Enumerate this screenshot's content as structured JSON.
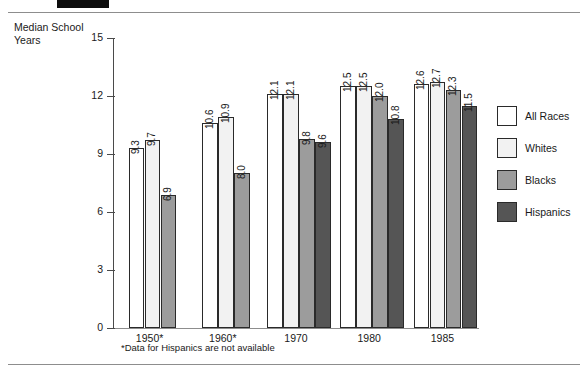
{
  "header": {
    "figure_number": "12",
    "title": "1950-1985"
  },
  "axis_title": "Median School\nYears",
  "footnote": "*Data for Hispanics are not available",
  "legend": {
    "items": [
      {
        "label": "All Races",
        "color": "#ffffff"
      },
      {
        "label": "Whites",
        "color": "#f2f2f2"
      },
      {
        "label": "Blacks",
        "color": "#9c9c9c"
      },
      {
        "label": "Hispanics",
        "color": "#555555"
      }
    ]
  },
  "chart_data": {
    "type": "bar",
    "title": "1950-1985",
    "xlabel": "",
    "ylabel": "Median School Years",
    "ylim": [
      0,
      15
    ],
    "yticks": [
      "0",
      "3",
      "6",
      "9",
      "12",
      "15"
    ],
    "grid": false,
    "legend_position": "right",
    "categories": [
      "1950*",
      "1960*",
      "1970",
      "1980",
      "1985"
    ],
    "series": [
      {
        "name": "All Races",
        "color": "#ffffff",
        "values": [
          9.3,
          10.6,
          12.1,
          12.5,
          12.6
        ]
      },
      {
        "name": "Whites",
        "color": "#f2f2f2",
        "values": [
          9.7,
          10.9,
          12.1,
          12.5,
          12.7
        ]
      },
      {
        "name": "Blacks",
        "color": "#9c9c9c",
        "values": [
          6.9,
          8.0,
          9.8,
          12.0,
          12.3
        ]
      },
      {
        "name": "Hispanics",
        "color": "#555555",
        "values": [
          null,
          null,
          9.6,
          10.8,
          11.5
        ]
      }
    ],
    "annotations": [
      "*Data for Hispanics are not available"
    ]
  }
}
